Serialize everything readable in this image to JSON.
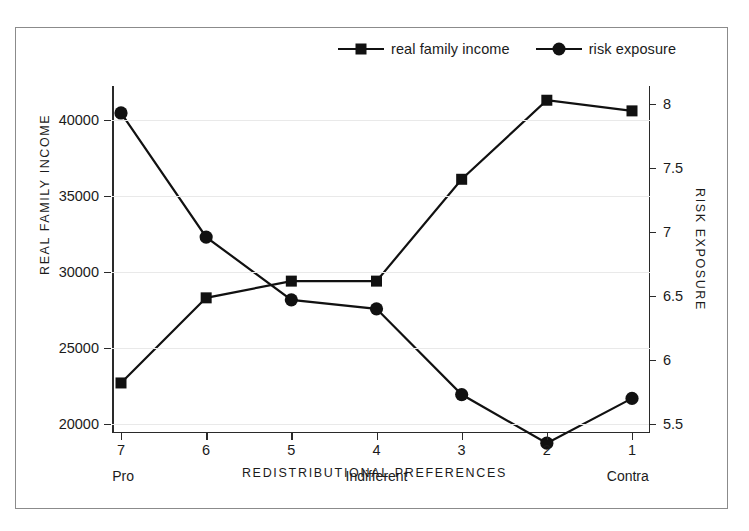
{
  "legend": {
    "items": [
      {
        "label": "real family income",
        "marker": "square-marker-icon"
      },
      {
        "label": "risk exposure",
        "marker": "circle-marker-icon"
      }
    ]
  },
  "axes": {
    "left_title": "REAL FAMILY INCOME",
    "right_title": "RISK EXPOSURE",
    "x_title": "REDISTRIBUTIONAL PREFERENCES",
    "left_ticks": [
      "20000",
      "25000",
      "30000",
      "35000",
      "40000"
    ],
    "right_ticks": [
      "5.5",
      "6",
      "6.5",
      "7",
      "7.5",
      "8"
    ],
    "x_ticks": [
      "7",
      "6",
      "5",
      "4",
      "3",
      "2",
      "1"
    ],
    "x_sublabels": [
      {
        "at": "7",
        "text": "Pro"
      },
      {
        "at": "4",
        "text": "Indifferent"
      },
      {
        "at": "1",
        "text": "Contra"
      }
    ]
  },
  "colors": {
    "line": "#111111",
    "frame": "#8b8b8b",
    "grid": "#e9e9e9",
    "axis": "#2a2a2a",
    "text": "#1b1b1b"
  },
  "chart_data": {
    "type": "line",
    "title": "",
    "xlabel": "REDISTRIBUTIONAL PREFERENCES",
    "categories": [
      "7",
      "6",
      "5",
      "4",
      "3",
      "2",
      "1"
    ],
    "category_anchors": [
      "Pro",
      "",
      "",
      "Indifferent",
      "",
      "",
      "Contra"
    ],
    "grid": true,
    "legend_position": "top-center",
    "series": [
      {
        "name": "real family income",
        "axis": "left",
        "marker": "square",
        "ylabel": "REAL FAMILY INCOME",
        "ylim": [
          20000,
          41600
        ],
        "yticks": [
          20000,
          25000,
          30000,
          35000,
          40000
        ],
        "values": [
          22700,
          28300,
          29400,
          29400,
          36100,
          41300,
          40600
        ]
      },
      {
        "name": "risk exposure",
        "axis": "right",
        "marker": "circle",
        "ylabel": "RISK EXPOSURE",
        "ylim": [
          5.3,
          8.0
        ],
        "yticks": [
          5.5,
          6,
          6.5,
          7,
          7.5,
          8
        ],
        "values": [
          7.93,
          6.96,
          6.47,
          6.4,
          5.73,
          5.35,
          5.7
        ]
      }
    ]
  }
}
